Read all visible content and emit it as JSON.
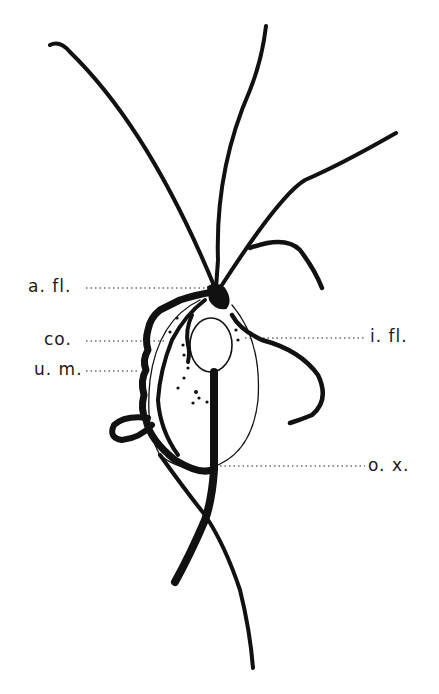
{
  "diagram": {
    "colors": {
      "ink": "#111111",
      "background": "#ffffff"
    },
    "labels": [
      {
        "id": "a_fl",
        "text": "a. fl.",
        "side": "left"
      },
      {
        "id": "co",
        "text": "co.",
        "side": "left"
      },
      {
        "id": "u_m",
        "text": "u. m.",
        "side": "left"
      },
      {
        "id": "i_fl",
        "text": "i. fl.",
        "side": "right"
      },
      {
        "id": "o_x",
        "text": "o. x.",
        "side": "right"
      }
    ]
  }
}
